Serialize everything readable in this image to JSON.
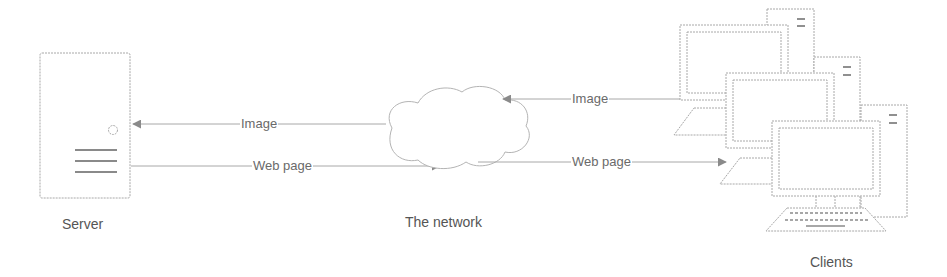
{
  "diagram": {
    "nodes": {
      "server": {
        "label": "Server"
      },
      "network": {
        "label": "The network"
      },
      "clients": {
        "label": "Clients",
        "count": 3
      }
    },
    "edges": [
      {
        "from": "network",
        "to": "server",
        "label": "Image"
      },
      {
        "from": "server",
        "to": "network",
        "label": "Web page"
      },
      {
        "from": "clients",
        "to": "network",
        "label": "Image"
      },
      {
        "from": "network",
        "to": "clients",
        "label": "Web page"
      }
    ]
  },
  "colors": {
    "stroke": "#a8a8a8",
    "arrowhead": "#8a8a8a",
    "text": "#6a6a6a"
  }
}
